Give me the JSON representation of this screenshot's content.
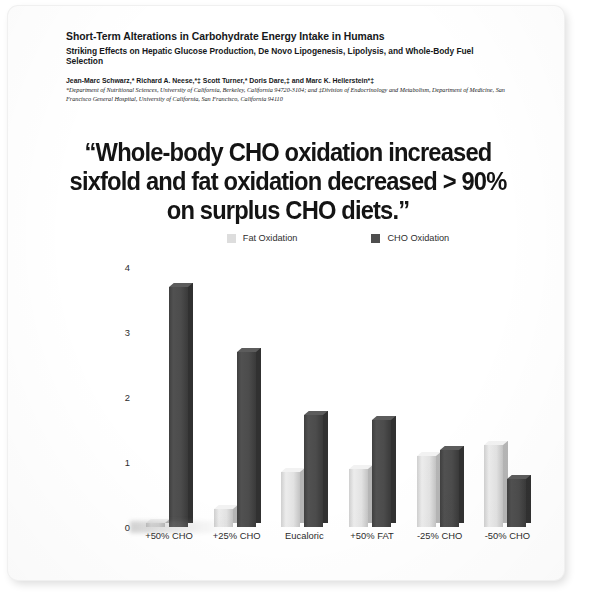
{
  "slide": {
    "header": {
      "article_title": "Short-Term Alterations in Carbohydrate Energy Intake in Humans",
      "article_subtitle": "Striking Effects on Hepatic Glucose Production, De Novo Lipogenesis, Lipolysis, and Whole-Body Fuel Selection",
      "authors": "Jean-Marc Schwarz,* Richard A. Neese,*‡ Scott Turner,* Doris Dare,‡ and Marc K. Hellerstein*‡",
      "affiliations": "*Department of Nutritional Sciences, University of California, Berkeley, California 94720-3104; and ‡Division of Endocrinology and Metabolism, Department of Medicine, San Francisco General Hospital, University of California, San Francisco, California 94110"
    },
    "pull_quote": "“Whole-body CHO oxidation increased sixfold and fat oxidation decreased > 90% on surplus CHO diets.”"
  },
  "chart_data": {
    "type": "bar",
    "title": "",
    "xlabel": "",
    "ylabel": "",
    "categories": [
      "+50% CHO",
      "+25% CHO",
      "Eucaloric",
      "+50% FAT",
      "-25% CHO",
      "-50% CHO"
    ],
    "series": [
      {
        "name": "Fat Oxidation",
        "color": "#dddddd",
        "values": [
          0.06,
          0.27,
          0.85,
          0.89,
          1.09,
          1.26
        ]
      },
      {
        "name": "CHO Oxidation",
        "color": "#4e4e4e",
        "values": [
          3.69,
          2.7,
          1.72,
          1.65,
          1.18,
          0.74
        ]
      }
    ],
    "yticks": [
      "0",
      "1",
      "2",
      "3",
      "4"
    ],
    "ylim": [
      0,
      4
    ],
    "grid": false,
    "legend_position": "top"
  },
  "legend": {
    "fat_label": "Fat Oxidation",
    "cho_label": "CHO Oxidation"
  }
}
